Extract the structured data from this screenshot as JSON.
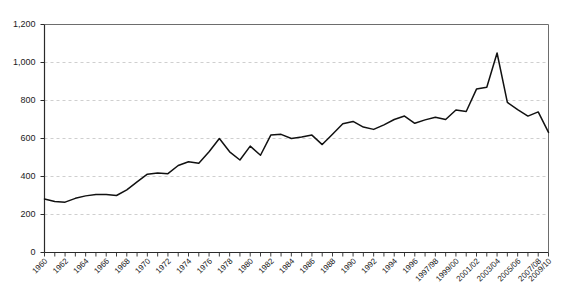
{
  "chart_data": {
    "type": "line",
    "title": "",
    "subtitle": "",
    "xlabel": "",
    "ylabel": "",
    "ylim": [
      0,
      1200
    ],
    "ytick_values": [
      0,
      200,
      400,
      600,
      800,
      1000,
      1200
    ],
    "ytick_labels": [
      "0",
      "200",
      "400",
      "600",
      "800",
      "1,000",
      "1,200"
    ],
    "grid": true,
    "grid_axis": "y",
    "legend": false,
    "legend_position": "none",
    "line_color": "#111111",
    "grid_color": "#cfcfcf",
    "axis_color": "#2a2a2a",
    "xtick_labels": [
      "1960",
      "1962",
      "1964",
      "1966",
      "1968",
      "1970",
      "1972",
      "1974",
      "1976",
      "1978",
      "1980",
      "1982",
      "1984",
      "1986",
      "1988",
      "1990",
      "1992",
      "1994",
      "1996",
      "1997/98",
      "1999/00",
      "2001/02",
      "2003/04",
      "2005/06",
      "2007/08",
      "2009/10"
    ],
    "x": [
      "1960",
      "1961",
      "1962",
      "1963",
      "1964",
      "1965",
      "1966",
      "1967",
      "1968",
      "1969",
      "1970",
      "1971",
      "1972",
      "1973",
      "1974",
      "1975",
      "1976",
      "1977",
      "1978",
      "1979",
      "1980",
      "1981",
      "1982",
      "1983",
      "1984",
      "1985",
      "1986",
      "1987",
      "1988",
      "1989",
      "1990",
      "1991",
      "1992",
      "1993",
      "1994",
      "1995",
      "1996",
      "1997/98",
      "1998/99",
      "1999/00",
      "2000/01",
      "2001/02",
      "2002/03",
      "2003/04",
      "2004/05",
      "2005/06",
      "2006/07",
      "2007/08",
      "2008/09",
      "2009/10"
    ],
    "values": [
      282,
      268,
      265,
      285,
      298,
      305,
      305,
      300,
      330,
      372,
      412,
      418,
      415,
      458,
      478,
      470,
      530,
      600,
      530,
      487,
      560,
      512,
      618,
      622,
      600,
      608,
      618,
      568,
      622,
      678,
      690,
      660,
      648,
      672,
      700,
      718,
      680,
      698,
      712,
      700,
      750,
      742,
      860,
      870,
      1050,
      790,
      752,
      718,
      740,
      632
    ],
    "annotations": []
  }
}
